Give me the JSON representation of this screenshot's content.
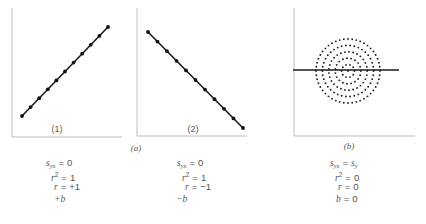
{
  "figure": {
    "panels": [
      {
        "id": "1",
        "label": "(1)",
        "group": "a"
      },
      {
        "id": "2",
        "label": "(2)",
        "group": "a"
      },
      {
        "id": "b",
        "label": "(b)",
        "group": "b"
      }
    ],
    "group_labels": {
      "a": "(a)",
      "b": "(b)"
    }
  },
  "stats": {
    "panel1": [
      {
        "lhs": "s",
        "sub": "yx",
        "sup": "",
        "rel": "=",
        "rhs": "0"
      },
      {
        "lhs": "r",
        "sub": "",
        "sup": "2",
        "rel": "=",
        "rhs": "1"
      },
      {
        "lhs": "r",
        "sub": "",
        "sup": "",
        "rel": "=",
        "rhs": "+1"
      },
      {
        "lhs": "+b",
        "sub": "",
        "sup": "",
        "rel": "",
        "rhs": ""
      }
    ],
    "panel2": [
      {
        "lhs": "s",
        "sub": "yx",
        "sup": "",
        "rel": "=",
        "rhs": "0"
      },
      {
        "lhs": "r",
        "sub": "",
        "sup": "2",
        "rel": "=",
        "rhs": "1"
      },
      {
        "lhs": "r",
        "sub": "",
        "sup": "",
        "rel": "=",
        "rhs": "−1"
      },
      {
        "lhs": "−b",
        "sub": "",
        "sup": "",
        "rel": "",
        "rhs": ""
      }
    ],
    "panelb": [
      {
        "lhs": "s",
        "sub": "yx",
        "sup": "",
        "rel": "=",
        "rhs": "s",
        "rhs_sub": "y"
      },
      {
        "lhs": "r",
        "sub": "",
        "sup": "2",
        "rel": "=",
        "rhs": "0"
      },
      {
        "lhs": "r",
        "sub": "",
        "sup": "",
        "rel": "=",
        "rhs": "0"
      },
      {
        "lhs": "b",
        "sub": "",
        "sup": "",
        "rel": "=",
        "rhs": "0"
      }
    ]
  },
  "chart_data": [
    {
      "type": "scatter",
      "title": "(1) Perfect positive linear relationship",
      "xlabel": "",
      "ylabel": "",
      "points": [
        [
          0,
          0
        ],
        [
          1,
          1
        ],
        [
          2,
          2
        ],
        [
          3,
          3
        ],
        [
          4,
          4
        ],
        [
          5,
          5
        ],
        [
          6,
          6
        ],
        [
          7,
          7
        ],
        [
          8,
          8
        ],
        [
          9,
          9
        ],
        [
          10,
          10
        ]
      ],
      "fit_line": {
        "slope": 1,
        "intercept": 0
      },
      "grid": false,
      "annotations": [
        "s_yx = 0",
        "r^2 = 1",
        "r = +1",
        "+b"
      ]
    },
    {
      "type": "scatter",
      "title": "(2) Perfect negative linear relationship",
      "xlabel": "",
      "ylabel": "",
      "points": [
        [
          0,
          10
        ],
        [
          1,
          9
        ],
        [
          2,
          8
        ],
        [
          3,
          7
        ],
        [
          4,
          6
        ],
        [
          5,
          5
        ],
        [
          6,
          4
        ],
        [
          7,
          3
        ],
        [
          8,
          2
        ],
        [
          9,
          1
        ],
        [
          10,
          0
        ]
      ],
      "fit_line": {
        "slope": -1,
        "intercept": 10
      },
      "grid": false,
      "annotations": [
        "s_yx = 0",
        "r^2 = 1",
        "r = -1",
        "-b"
      ]
    },
    {
      "type": "scatter",
      "title": "(b) No linear relationship (concentric circular scatter)",
      "xlabel": "",
      "ylabel": "",
      "shape": "5 concentric rings of dots plus center point",
      "ring_radii_relative": [
        1.0,
        0.8,
        0.6,
        0.4,
        0.2
      ],
      "fit_line": {
        "slope": 0,
        "intercept": "mean of y"
      },
      "grid": false,
      "annotations": [
        "s_yx = s_y",
        "r^2 = 0",
        "r = 0",
        "b = 0"
      ]
    }
  ]
}
